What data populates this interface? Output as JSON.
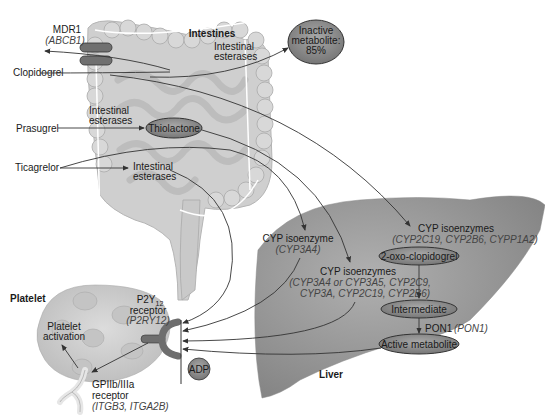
{
  "regions": {
    "intestines": "Intestines",
    "liver": "Liver",
    "platelet": "Platelet"
  },
  "drugs": {
    "clopidogrel": "Clopidogrel",
    "prasugrel": "Prasugrel",
    "ticagrelor": "Ticagrelor"
  },
  "transporter": {
    "name": "MDR1",
    "gene": "(ABCB1)"
  },
  "intestinal_esterases": {
    "line1": "Intestinal",
    "line2": "esterases"
  },
  "nodes": {
    "inactive_metabolite": {
      "line1": "Inactive",
      "line2": "metabolite:",
      "line3": "85%"
    },
    "thiolactone": "Thiolactone",
    "oxo_clopidogrel": "2-oxo-clopidogrel",
    "intermediate": "Intermediate",
    "active_metabolite": "Active metabolite",
    "adp": "ADP"
  },
  "enzymes": {
    "cyp3a4_single": {
      "title": "CYP isoenzyme",
      "genes": "(CYP3A4)"
    },
    "cyp_clopidogrel_step1": {
      "title": "CYP isoenzymes",
      "genes": "(CYP2C19, CYP2B6, CYPP1A2)"
    },
    "cyp_clopidogrel_step2": {
      "title": "CYP isoenzymes",
      "genes_line1": "(CYP3A4 or CYP3A5, CYP2C9,",
      "genes_line2": "CYP3A, CYP2C19, CYP2B6)"
    },
    "pon1": {
      "name": "PON1",
      "gene": "(PON1)"
    }
  },
  "receptors": {
    "p2y12": {
      "name": "P2Y",
      "sub": "12",
      "line2": "receptor",
      "gene": "(P2RY12)"
    },
    "gpiib": {
      "line1": "GPIIb/IIIa",
      "line2": "receptor",
      "gene": "(ITGB3, ITGA2B)"
    }
  },
  "platelet_activation": {
    "line1": "Platelet",
    "line2": "activation"
  },
  "colors": {
    "node_fill": "#8a8a8a",
    "liver_fill": "#9a9a9a",
    "intestine_fill": "#d2d2d2",
    "platelet_fill": "#cfcfcf",
    "arrow": "#333333"
  }
}
